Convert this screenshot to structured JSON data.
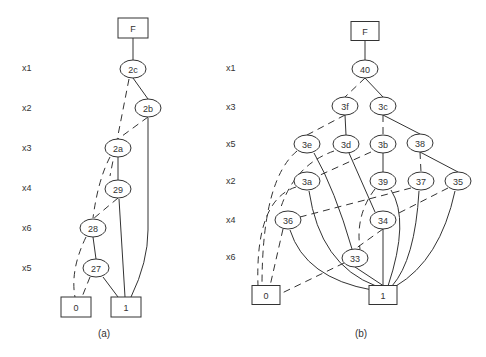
{
  "colors": {
    "stroke": "#333333",
    "background": "#ffffff"
  },
  "diagrams": [
    {
      "id": "a",
      "caption": "(a)",
      "caption_pos": [
        104,
        337
      ],
      "rows": [
        {
          "label": "x1",
          "y": 68
        },
        {
          "label": "x2",
          "y": 108
        },
        {
          "label": "x3",
          "y": 148
        },
        {
          "label": "x4",
          "y": 188
        },
        {
          "label": "x6",
          "y": 228
        },
        {
          "label": "x5",
          "y": 268
        }
      ],
      "row_label_x": 22,
      "nodes": [
        {
          "id": "F",
          "label": "F",
          "shape": "box",
          "x": 133,
          "y": 28,
          "w": 30,
          "h": 20
        },
        {
          "id": "2c",
          "label": "2c",
          "shape": "ellipse",
          "x": 133,
          "y": 69
        },
        {
          "id": "2b",
          "label": "2b",
          "shape": "ellipse",
          "x": 148,
          "y": 108
        },
        {
          "id": "2a",
          "label": "2a",
          "shape": "ellipse",
          "x": 118,
          "y": 148
        },
        {
          "id": "29",
          "label": "29",
          "shape": "ellipse",
          "x": 118,
          "y": 189
        },
        {
          "id": "28",
          "label": "28",
          "shape": "ellipse",
          "x": 93,
          "y": 228
        },
        {
          "id": "27",
          "label": "27",
          "shape": "ellipse",
          "x": 96,
          "y": 268
        },
        {
          "id": "0",
          "label": "0",
          "shape": "box",
          "x": 76,
          "y": 307,
          "w": 30,
          "h": 20
        },
        {
          "id": "1",
          "label": "1",
          "shape": "box",
          "x": 126,
          "y": 307,
          "w": 30,
          "h": 20
        }
      ],
      "edges": [
        {
          "from": "F",
          "to": "2c",
          "style": "solid"
        },
        {
          "from": "2c",
          "to": "2b",
          "style": "solid"
        },
        {
          "from": "2c",
          "to": "29",
          "style": "dashed",
          "path": "M129,79 L110,176"
        },
        {
          "from": "2b",
          "to": "1",
          "style": "solid",
          "path": "M148,118 L148,230 Q148,262 131,297"
        },
        {
          "from": "2b",
          "to": "2a",
          "style": "dashed"
        },
        {
          "from": "2a",
          "to": "29",
          "style": "solid"
        },
        {
          "from": "2a",
          "to": "28",
          "style": "dashed",
          "path": "M110,157 Q98,180 93,218"
        },
        {
          "from": "29",
          "to": "1",
          "style": "solid",
          "path": "M119,199 L125,297"
        },
        {
          "from": "29",
          "to": "28",
          "style": "dashed"
        },
        {
          "from": "28",
          "to": "27",
          "style": "solid"
        },
        {
          "from": "28",
          "to": "0",
          "style": "dashed",
          "path": "M86,237 Q70,270 75,297"
        },
        {
          "from": "27",
          "to": "1",
          "style": "solid",
          "path": "M103,277 L118,297"
        },
        {
          "from": "27",
          "to": "0",
          "style": "dashed",
          "path": "M90,277 L82,297"
        }
      ]
    },
    {
      "id": "b",
      "caption": "(b)",
      "caption_pos": [
        361,
        337
      ],
      "rows": [
        {
          "label": "x1",
          "y": 68
        },
        {
          "label": "x3",
          "y": 107
        },
        {
          "label": "x5",
          "y": 144
        },
        {
          "label": "x2",
          "y": 181
        },
        {
          "label": "x4",
          "y": 220
        },
        {
          "label": "x6",
          "y": 257
        }
      ],
      "row_label_x": 226,
      "nodes": [
        {
          "id": "F",
          "label": "F",
          "shape": "box",
          "x": 365,
          "y": 31,
          "w": 28,
          "h": 19
        },
        {
          "id": "40",
          "label": "40",
          "shape": "ellipse",
          "x": 365,
          "y": 69
        },
        {
          "id": "3f",
          "label": "3f",
          "shape": "ellipse",
          "x": 345,
          "y": 106
        },
        {
          "id": "3c",
          "label": "3c",
          "shape": "ellipse",
          "x": 383,
          "y": 106
        },
        {
          "id": "3e",
          "label": "3e",
          "shape": "ellipse",
          "x": 307,
          "y": 144
        },
        {
          "id": "3d",
          "label": "3d",
          "shape": "ellipse",
          "x": 346,
          "y": 144
        },
        {
          "id": "3b",
          "label": "3b",
          "shape": "ellipse",
          "x": 383,
          "y": 144
        },
        {
          "id": "38",
          "label": "38",
          "shape": "ellipse",
          "x": 420,
          "y": 143
        },
        {
          "id": "3a",
          "label": "3a",
          "shape": "ellipse",
          "x": 307,
          "y": 181
        },
        {
          "id": "39",
          "label": "39",
          "shape": "ellipse",
          "x": 383,
          "y": 181
        },
        {
          "id": "37",
          "label": "37",
          "shape": "ellipse",
          "x": 421,
          "y": 181
        },
        {
          "id": "35",
          "label": "35",
          "shape": "ellipse",
          "x": 458,
          "y": 181
        },
        {
          "id": "36",
          "label": "36",
          "shape": "ellipse",
          "x": 288,
          "y": 220
        },
        {
          "id": "34",
          "label": "34",
          "shape": "ellipse",
          "x": 383,
          "y": 220
        },
        {
          "id": "33",
          "label": "33",
          "shape": "ellipse",
          "x": 355,
          "y": 258
        },
        {
          "id": "0",
          "label": "0",
          "shape": "box",
          "x": 266,
          "y": 295,
          "w": 28,
          "h": 19
        },
        {
          "id": "1",
          "label": "1",
          "shape": "box",
          "x": 383,
          "y": 295,
          "w": 28,
          "h": 19
        }
      ],
      "edges": [
        {
          "from": "F",
          "to": "40",
          "style": "solid"
        },
        {
          "from": "40",
          "to": "3c",
          "style": "solid"
        },
        {
          "from": "40",
          "to": "3f",
          "style": "dashed"
        },
        {
          "from": "3f",
          "to": "3d",
          "style": "solid"
        },
        {
          "from": "3f",
          "to": "3e",
          "style": "dashed"
        },
        {
          "from": "3c",
          "to": "38",
          "style": "solid"
        },
        {
          "from": "3c",
          "to": "3b",
          "style": "dashed"
        },
        {
          "from": "3e",
          "to": "33",
          "style": "solid",
          "path": "M314,153 Q335,190 352,249"
        },
        {
          "from": "3e",
          "to": "0",
          "style": "dashed",
          "path": "M297,151 Q262,180 262,286"
        },
        {
          "from": "3d",
          "to": "34",
          "style": "solid",
          "path": "M349,153 L375,212"
        },
        {
          "from": "3d",
          "to": "36",
          "style": "dashed",
          "path": "M334,151 Q294,165 280,210"
        },
        {
          "from": "3b",
          "to": "39",
          "style": "solid"
        },
        {
          "from": "3b",
          "to": "3a",
          "style": "dashed",
          "path": "M371,152 L318,176"
        },
        {
          "from": "38",
          "to": "35",
          "style": "solid"
        },
        {
          "from": "38",
          "to": "37",
          "style": "dashed"
        },
        {
          "from": "3a",
          "to": "1",
          "style": "solid",
          "path": "M309,191 Q320,265 376,286"
        },
        {
          "from": "3a",
          "to": "0",
          "style": "dashed",
          "path": "M296,187 Q255,200 258,286"
        },
        {
          "from": "39",
          "to": "1",
          "style": "solid",
          "path": "M391,190 Q410,220 388,286"
        },
        {
          "from": "39",
          "to": "33",
          "style": "dashed",
          "path": "M375,189 Q355,215 360,249"
        },
        {
          "from": "37",
          "to": "1",
          "style": "solid",
          "path": "M419,191 Q415,260 392,286"
        },
        {
          "from": "37",
          "to": "36",
          "style": "dashed",
          "path": "M411,188 L300,217"
        },
        {
          "from": "35",
          "to": "1",
          "style": "solid",
          "path": "M455,191 Q440,260 396,286"
        },
        {
          "from": "35",
          "to": "34",
          "style": "dashed",
          "path": "M448,188 L393,216"
        },
        {
          "from": "36",
          "to": "1",
          "style": "solid",
          "path": "M290,230 Q305,278 372,290"
        },
        {
          "from": "36",
          "to": "0",
          "style": "dashed",
          "path": "M283,229 L270,286"
        },
        {
          "from": "34",
          "to": "1",
          "style": "solid"
        },
        {
          "from": "34",
          "to": "33",
          "style": "dashed"
        },
        {
          "from": "33",
          "to": "1",
          "style": "solid"
        },
        {
          "from": "33",
          "to": "0",
          "style": "dashed",
          "path": "M344,263 L280,294"
        }
      ]
    }
  ]
}
